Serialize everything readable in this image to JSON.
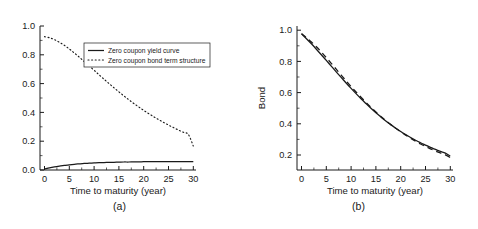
{
  "figure": {
    "panels": [
      {
        "caption": "(a)",
        "xlabel": "Time to maturity (year)",
        "ylabel": "",
        "xticks": [
          "0",
          "5",
          "10",
          "15",
          "20",
          "25",
          "30"
        ],
        "yticks": [
          "0.0",
          "0.2",
          "0.4",
          "0.6",
          "0.8",
          "1.0"
        ],
        "legend": {
          "items": [
            {
              "label": "Zero coupon yield curve",
              "style": "solid"
            },
            {
              "label": "Zero coupon bond term structure",
              "style": "dotted"
            }
          ]
        }
      },
      {
        "caption": "(b)",
        "xlabel": "Time to maturity (year)",
        "ylabel": "Bond",
        "xticks": [
          "0",
          "5",
          "10",
          "15",
          "20",
          "25",
          "30"
        ],
        "yticks": [
          "0.2",
          "0.4",
          "0.6",
          "0.8",
          "1.0"
        ]
      }
    ]
  },
  "chart_data": [
    {
      "type": "line",
      "title": "",
      "panel": "(a)",
      "xlabel": "Time to maturity (year)",
      "ylabel": "",
      "xlim": [
        0,
        31.5
      ],
      "ylim": [
        0.0,
        1.08
      ],
      "grid": false,
      "legend_position": "upper-center",
      "x": [
        0,
        1,
        2,
        3,
        4,
        5,
        6,
        7,
        8,
        9,
        10,
        11,
        12,
        13,
        14,
        15,
        16,
        17,
        18,
        19,
        20,
        21,
        22,
        23,
        24,
        25,
        26,
        27,
        28,
        29,
        30
      ],
      "series": [
        {
          "name": "Zero coupon yield curve",
          "style": "solid",
          "color": "#1a1a1a",
          "values": [
            0.008,
            0.016,
            0.023,
            0.029,
            0.034,
            0.039,
            0.043,
            0.046,
            0.049,
            0.051,
            0.053,
            0.055,
            0.056,
            0.057,
            0.058,
            0.059,
            0.06,
            0.06,
            0.061,
            0.061,
            0.062,
            0.062,
            0.062,
            0.062,
            0.062,
            0.062,
            0.062,
            0.062,
            0.062,
            0.062,
            0.062
          ]
        },
        {
          "name": "Zero coupon bond term structure",
          "style": "dotted",
          "color": "#1a1a1a",
          "values": [
            1.0,
            0.992,
            0.978,
            0.958,
            0.935,
            0.908,
            0.878,
            0.847,
            0.814,
            0.781,
            0.748,
            0.714,
            0.681,
            0.649,
            0.617,
            0.586,
            0.556,
            0.527,
            0.499,
            0.473,
            0.447,
            0.423,
            0.4,
            0.378,
            0.357,
            0.337,
            0.318,
            0.3,
            0.283,
            0.267,
            0.18
          ]
        }
      ]
    },
    {
      "type": "line",
      "title": "",
      "panel": "(b)",
      "xlabel": "Time to maturity (year)",
      "ylabel": "Bond",
      "xlim": [
        0,
        31.5
      ],
      "ylim": [
        0.12,
        1.05
      ],
      "grid": false,
      "legend_position": "none",
      "x": [
        0,
        1,
        2,
        3,
        4,
        5,
        6,
        7,
        8,
        9,
        10,
        11,
        12,
        13,
        14,
        15,
        16,
        17,
        18,
        19,
        20,
        21,
        22,
        23,
        24,
        25,
        26,
        27,
        28,
        29,
        30
      ],
      "series": [
        {
          "name": "Bond price (solid)",
          "style": "solid",
          "color": "#1a1a1a",
          "values": [
            1.0,
            0.968,
            0.935,
            0.9,
            0.864,
            0.828,
            0.791,
            0.754,
            0.718,
            0.682,
            0.647,
            0.613,
            0.58,
            0.549,
            0.519,
            0.49,
            0.463,
            0.437,
            0.413,
            0.39,
            0.369,
            0.349,
            0.33,
            0.312,
            0.296,
            0.281,
            0.266,
            0.253,
            0.24,
            0.229,
            0.21
          ]
        },
        {
          "name": "Bond price (dashed)",
          "style": "dashed",
          "color": "#1a1a1a",
          "values": [
            1.0,
            0.975,
            0.947,
            0.916,
            0.882,
            0.846,
            0.809,
            0.771,
            0.733,
            0.696,
            0.659,
            0.624,
            0.59,
            0.557,
            0.525,
            0.495,
            0.466,
            0.439,
            0.413,
            0.389,
            0.366,
            0.345,
            0.325,
            0.306,
            0.288,
            0.272,
            0.257,
            0.243,
            0.23,
            0.218,
            0.2
          ]
        }
      ]
    }
  ]
}
